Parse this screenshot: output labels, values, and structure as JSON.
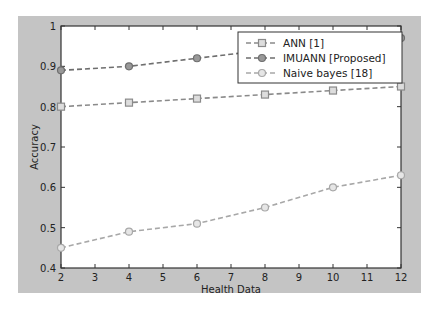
{
  "chart_data": {
    "type": "line",
    "title": "",
    "xlabel": "Health Data",
    "ylabel": "Accuracy",
    "x": [
      2,
      4,
      6,
      8,
      10,
      12
    ],
    "xlim": [
      2,
      12
    ],
    "ylim": [
      0.4,
      1.0
    ],
    "xticks": [
      "2",
      "3",
      "4",
      "5",
      "6",
      "7",
      "8",
      "9",
      "10",
      "11",
      "12"
    ],
    "yticks": [
      "0.4",
      "0.5",
      "0.6",
      "0.7",
      "0.8",
      "0.9",
      "1"
    ],
    "grid": false,
    "legend_position": "upper right",
    "series": [
      {
        "name": "ANN [1]",
        "marker": "square",
        "color": "#8a8a8a",
        "values": [
          0.8,
          0.81,
          0.82,
          0.83,
          0.84,
          0.85
        ]
      },
      {
        "name": "IMUANN [Proposed]",
        "marker": "circle-filled",
        "color": "#6e6e6e",
        "values": [
          0.89,
          0.9,
          0.92,
          0.94,
          0.96,
          0.97
        ]
      },
      {
        "name": "Naive bayes [18]",
        "marker": "circle",
        "color": "#a8a8a8",
        "values": [
          0.45,
          0.49,
          0.51,
          0.55,
          0.6,
          0.63
        ]
      }
    ]
  }
}
